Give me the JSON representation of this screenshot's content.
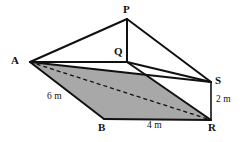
{
  "figure": {
    "kind": "geometry-diagram",
    "canvas": {
      "width": 244,
      "height": 142,
      "background": "#ffffff"
    },
    "style": {
      "stroke_color": "#111111",
      "shade_fill": "#a8a8a8",
      "white_fill": "#ffffff",
      "edge_width_px": 2,
      "thin_edge_width_px": 1.3,
      "dashed_pattern": "4 3"
    },
    "vertices": [
      {
        "id": "A",
        "label": "A",
        "x": 30,
        "y": 62,
        "label_x": 11,
        "label_y": 55
      },
      {
        "id": "P",
        "label": "P",
        "x": 127,
        "y": 19,
        "label_x": 123,
        "label_y": 4
      },
      {
        "id": "Q",
        "label": "Q",
        "x": 127,
        "y": 62,
        "label_x": 114,
        "label_y": 46
      },
      {
        "id": "S",
        "label": "S",
        "x": 211,
        "y": 82,
        "label_x": 215,
        "label_y": 75
      },
      {
        "id": "R",
        "label": "R",
        "x": 211,
        "y": 120,
        "label_x": 208,
        "label_y": 122
      },
      {
        "id": "B",
        "label": "B",
        "x": 104,
        "y": 119,
        "label_x": 98,
        "label_y": 122
      }
    ],
    "faces": [
      {
        "id": "cross-section-ASRB",
        "points": "30,62 211,82 211,120 104,119",
        "fill": "#a8a8a8"
      },
      {
        "id": "face-QSR",
        "points": "127,62 211,82 211,120",
        "fill": "#ffffff"
      }
    ],
    "edges": [
      {
        "id": "A-P",
        "from": "A",
        "to": "P",
        "style": "solid"
      },
      {
        "id": "P-S",
        "from": "P",
        "to": "S",
        "style": "solid"
      },
      {
        "id": "P-Q",
        "from": "P",
        "to": "Q",
        "style": "solid"
      },
      {
        "id": "A-Q",
        "from": "A",
        "to": "Q",
        "style": "solid"
      },
      {
        "id": "Q-S",
        "from": "Q",
        "to": "S",
        "style": "solid"
      },
      {
        "id": "A-S",
        "from": "A",
        "to": "S",
        "style": "solid"
      },
      {
        "id": "A-B",
        "from": "A",
        "to": "B",
        "style": "solid"
      },
      {
        "id": "B-R",
        "from": "B",
        "to": "R",
        "style": "solid"
      },
      {
        "id": "S-R",
        "from": "S",
        "to": "R",
        "style": "solid"
      },
      {
        "id": "Q-R",
        "from": "Q",
        "to": "R",
        "style": "solid"
      },
      {
        "id": "A-R",
        "from": "A",
        "to": "R",
        "style": "dashed"
      }
    ],
    "dimension_labels": [
      {
        "id": "edge-AB-length",
        "text": "6 m",
        "x": 47,
        "y": 92,
        "measures": "A-B"
      },
      {
        "id": "edge-BR-length",
        "text": "4 m",
        "x": 147,
        "y": 121,
        "measures": "B-R"
      },
      {
        "id": "edge-SR-length",
        "text": "2 m",
        "x": 216,
        "y": 95,
        "measures": "S-R"
      }
    ]
  }
}
